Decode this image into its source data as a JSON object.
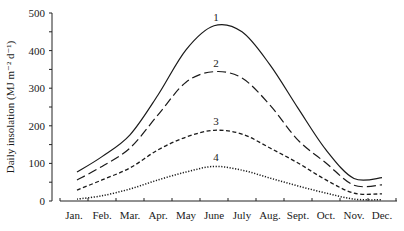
{
  "chart_data": {
    "type": "line",
    "title": "",
    "xlabel": "",
    "ylabel": "Daily insolation (MJ m⁻² d⁻¹)",
    "ylim": [
      0,
      500
    ],
    "yticks": [
      0,
      100,
      200,
      300,
      400,
      500
    ],
    "grid": false,
    "legend": "inline numeric labels at curve peaks",
    "categories": [
      "Jan.",
      "Feb.",
      "Mar.",
      "Apr.",
      "May",
      "June",
      "July",
      "Aug.",
      "Sept.",
      "Oct.",
      "Nov.",
      "Dec."
    ],
    "series": [
      {
        "name": "1",
        "style": "solid",
        "values": [
          77,
          118,
          176,
          282,
          402,
          466,
          450,
          362,
          247,
          136,
          60,
          62
        ]
      },
      {
        "name": "2",
        "style": "long-dash",
        "values": [
          56,
          92,
          141,
          229,
          316,
          344,
          327,
          255,
          162,
          101,
          42,
          43
        ]
      },
      {
        "name": "3",
        "style": "short-dash",
        "values": [
          29,
          56,
          88,
          136,
          170,
          188,
          178,
          141,
          101,
          56,
          21,
          19
        ]
      },
      {
        "name": "4",
        "style": "dotted",
        "values": [
          5,
          14,
          32,
          56,
          77,
          92,
          82,
          61,
          40,
          21,
          5,
          3
        ]
      }
    ]
  },
  "layout": {
    "plot_left": 52,
    "x_axis_start": 60,
    "x_axis_end": 397,
    "y_zero_px": 201,
    "y_max_px": 13,
    "month_width": 28
  }
}
